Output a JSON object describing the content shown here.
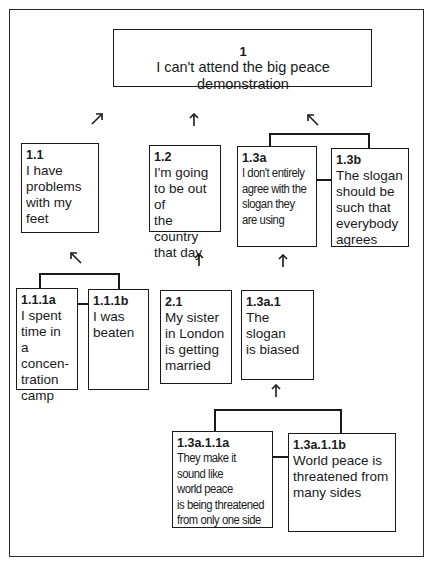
{
  "diagram": {
    "type": "argument-structure-tree",
    "nodes": [
      {
        "id": "1",
        "label": "1",
        "text": "I can't attend the big peace demonstration"
      },
      {
        "id": "1.1",
        "label": "1.1",
        "text": "I have\nproblems\nwith my feet"
      },
      {
        "id": "1.2",
        "label": "1.2",
        "text": "I'm going\nto be out of\nthe country\nthat day"
      },
      {
        "id": "1.3a",
        "label": "1.3a",
        "text": "I don't entirely\nagree with the\nslogan they\nare using"
      },
      {
        "id": "1.3b",
        "label": "1.3b",
        "text": "The slogan\nshould be\nsuch that\neverybody\nagrees"
      },
      {
        "id": "1.1.1a",
        "label": "1.1.1a",
        "text": "I spent\ntime in\na concen-\ntration\ncamp"
      },
      {
        "id": "1.1.1b",
        "label": "1.1.1b",
        "text": "I was\nbeaten"
      },
      {
        "id": "2.1",
        "label": "2.1",
        "text": "My sister\nin London\nis getting\nmarried"
      },
      {
        "id": "1.3a.1",
        "label": "1.3a.1",
        "text": "The slogan\nis biased"
      },
      {
        "id": "1.3a.1.1a",
        "label": "1.3a.1.1a",
        "text": "They make it\nsound like\nworld peace\nis being threatened\nfrom only one side"
      },
      {
        "id": "1.3a.1.1b",
        "label": "1.3a.1.1b",
        "text": "World peace is\nthreatened from\nmany sides"
      }
    ],
    "edges": [
      {
        "from": "1.1",
        "to": "1",
        "arrow": "up-right"
      },
      {
        "from": "1.2",
        "to": "1",
        "arrow": "up"
      },
      {
        "from": "1.3a+1.3b",
        "to": "1",
        "arrow": "up-left",
        "coordinated": true
      },
      {
        "from": "1.1.1a+1.1.1b",
        "to": "1.1",
        "arrow": "up-left",
        "coordinated": true
      },
      {
        "from": "2.1",
        "to": "1.2",
        "arrow": "up"
      },
      {
        "from": "1.3a.1",
        "to": "1.3a",
        "arrow": "up"
      },
      {
        "from": "1.3a.1.1a+1.3a.1.1b",
        "to": "1.3a.1",
        "arrow": "up",
        "coordinated": true
      }
    ]
  }
}
